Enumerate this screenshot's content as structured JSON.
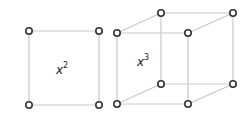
{
  "square": {
    "label_base": "x",
    "label_exp": "2",
    "vertices": [
      [
        29,
        31
      ],
      [
        99,
        31
      ],
      [
        99,
        105
      ],
      [
        29,
        105
      ]
    ]
  },
  "cube": {
    "label_base": "x",
    "label_exp": "3",
    "front": [
      [
        117,
        33
      ],
      [
        188,
        33
      ],
      [
        188,
        104
      ],
      [
        117,
        104
      ]
    ],
    "back": [
      [
        161,
        13
      ],
      [
        233,
        13
      ],
      [
        233,
        84
      ],
      [
        161,
        84
      ]
    ]
  },
  "colors": {
    "edge": "#c8c8c8",
    "node_stroke": "#333333"
  }
}
